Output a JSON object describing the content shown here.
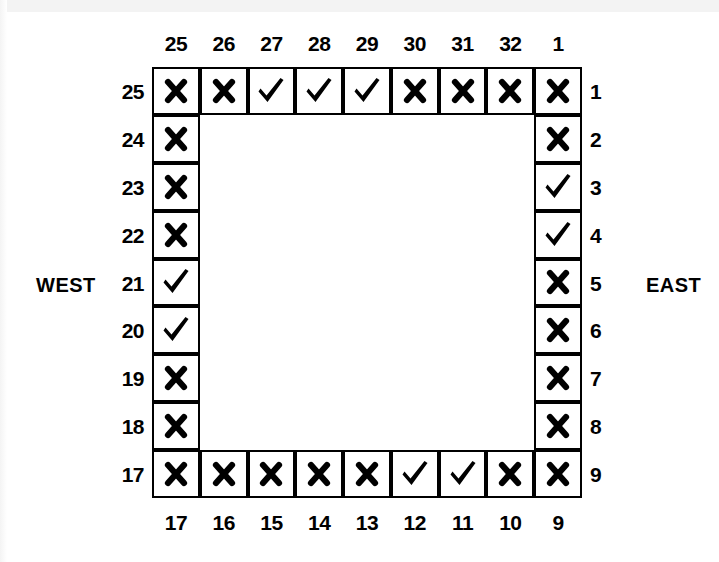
{
  "diagram": {
    "title": "",
    "type": "perimeter-ring-checklist",
    "grid_size": 9,
    "colors": {
      "ink": "#000000",
      "paper": "#ffffff"
    },
    "mark_names": {
      "check": "check-mark-icon",
      "cross": "cross-mark-icon"
    }
  },
  "side_labels": {
    "west": "WEST",
    "east": "EAST"
  },
  "axes": {
    "top_numbers": [
      "25",
      "26",
      "27",
      "28",
      "29",
      "30",
      "31",
      "32",
      "1"
    ],
    "bottom_numbers": [
      "17",
      "16",
      "15",
      "14",
      "13",
      "12",
      "11",
      "10",
      "9"
    ],
    "left_numbers": [
      "25",
      "24",
      "23",
      "22",
      "21",
      "20",
      "19",
      "18",
      "17"
    ],
    "right_numbers": [
      "1",
      "2",
      "3",
      "4",
      "5",
      "6",
      "7",
      "8",
      "9"
    ]
  },
  "marks": {
    "top_row": [
      "cross",
      "cross",
      "check",
      "check",
      "check",
      "cross",
      "cross",
      "cross",
      "cross"
    ],
    "bottom_row": [
      "cross",
      "cross",
      "cross",
      "cross",
      "cross",
      "check",
      "check",
      "cross",
      "cross"
    ],
    "left_col": [
      "cross",
      "cross",
      "cross",
      "cross",
      "check",
      "check",
      "cross",
      "cross",
      "cross"
    ],
    "right_col": [
      "cross",
      "cross",
      "check",
      "check",
      "cross",
      "cross",
      "cross",
      "cross",
      "cross"
    ]
  },
  "chart_data": {
    "type": "table",
    "title": "",
    "perimeter_positions": [
      {
        "position": "25",
        "side": "top",
        "mark": "cross"
      },
      {
        "position": "26",
        "side": "top",
        "mark": "cross"
      },
      {
        "position": "27",
        "side": "top",
        "mark": "check"
      },
      {
        "position": "28",
        "side": "top",
        "mark": "check"
      },
      {
        "position": "29",
        "side": "top",
        "mark": "check"
      },
      {
        "position": "30",
        "side": "top",
        "mark": "cross"
      },
      {
        "position": "31",
        "side": "top",
        "mark": "cross"
      },
      {
        "position": "32",
        "side": "top",
        "mark": "cross"
      },
      {
        "position": "1",
        "side": "top",
        "mark": "cross"
      },
      {
        "position": "2",
        "side": "east",
        "mark": "cross"
      },
      {
        "position": "3",
        "side": "east",
        "mark": "check"
      },
      {
        "position": "4",
        "side": "east",
        "mark": "check"
      },
      {
        "position": "5",
        "side": "east",
        "mark": "cross"
      },
      {
        "position": "6",
        "side": "east",
        "mark": "cross"
      },
      {
        "position": "7",
        "side": "east",
        "mark": "cross"
      },
      {
        "position": "8",
        "side": "east",
        "mark": "cross"
      },
      {
        "position": "9",
        "side": "east",
        "mark": "cross"
      },
      {
        "position": "10",
        "side": "bottom",
        "mark": "cross"
      },
      {
        "position": "11",
        "side": "bottom",
        "mark": "check"
      },
      {
        "position": "12",
        "side": "bottom",
        "mark": "check"
      },
      {
        "position": "13",
        "side": "bottom",
        "mark": "cross"
      },
      {
        "position": "14",
        "side": "bottom",
        "mark": "cross"
      },
      {
        "position": "15",
        "side": "bottom",
        "mark": "cross"
      },
      {
        "position": "16",
        "side": "bottom",
        "mark": "cross"
      },
      {
        "position": "17",
        "side": "bottom",
        "mark": "cross"
      },
      {
        "position": "18",
        "side": "west",
        "mark": "cross"
      },
      {
        "position": "19",
        "side": "west",
        "mark": "cross"
      },
      {
        "position": "20",
        "side": "west",
        "mark": "check"
      },
      {
        "position": "21",
        "side": "west",
        "mark": "check"
      },
      {
        "position": "22",
        "side": "west",
        "mark": "cross"
      },
      {
        "position": "23",
        "side": "west",
        "mark": "cross"
      },
      {
        "position": "24",
        "side": "west",
        "mark": "cross"
      }
    ],
    "check_count": 10,
    "cross_count": 22
  }
}
